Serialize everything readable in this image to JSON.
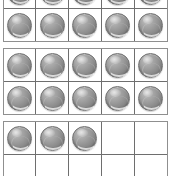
{
  "page": {
    "background_color": "#ffffff"
  },
  "style": {
    "counter_color": "#8e8e8e",
    "counter_highlight_color": "#c2c2c2",
    "counter_shadow_color": "#6e6e6e",
    "grid_line_color": "#6e6e6e",
    "frame_border_color": "#8f8f8f"
  },
  "manipulative": {
    "type": "ten-frame",
    "columns": 5,
    "rows_per_frame": 2,
    "cells_per_frame": 10,
    "frame_count": 3,
    "total_counters_shown": 23,
    "counter_icon_name": "gray-counter-chip"
  },
  "frames": [
    {
      "index": 1,
      "name": "ten-frame-1",
      "filled_count": 10,
      "rows": [
        {
          "name": "row-top",
          "cells": [
            true,
            true,
            true,
            true,
            true
          ]
        },
        {
          "name": "row-bottom",
          "cells": [
            true,
            true,
            true,
            true,
            true
          ]
        }
      ]
    },
    {
      "index": 2,
      "name": "ten-frame-2",
      "filled_count": 10,
      "rows": [
        {
          "name": "row-top",
          "cells": [
            true,
            true,
            true,
            true,
            true
          ]
        },
        {
          "name": "row-bottom",
          "cells": [
            true,
            true,
            true,
            true,
            true
          ]
        }
      ]
    },
    {
      "index": 3,
      "name": "ten-frame-3",
      "filled_count": 3,
      "rows": [
        {
          "name": "row-top",
          "cells": [
            true,
            true,
            true,
            false,
            false
          ]
        },
        {
          "name": "row-bottom",
          "cells": [
            false,
            false,
            false,
            false,
            false
          ]
        }
      ]
    }
  ]
}
